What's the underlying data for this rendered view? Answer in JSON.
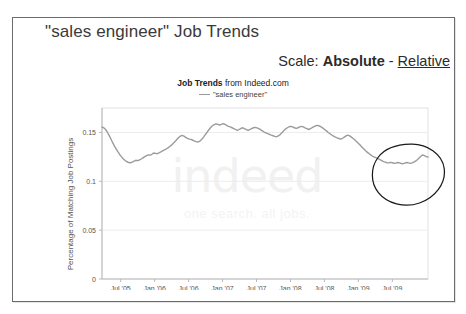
{
  "document": {
    "title": "\"sales engineer\" Job Trends"
  },
  "scale_control": {
    "label": "Scale:",
    "absolute_option": "Absolute",
    "separator": "-",
    "relative_option": "Relative",
    "selected": "Absolute"
  },
  "chart_header": {
    "source_bold": "Job Trends",
    "source_rest": " from Indeed.com",
    "legend_label": "\"sales engineer\""
  },
  "watermark": {
    "brand": "indeed",
    "tagline": "one search. all jobs."
  },
  "annotation": {
    "shape": "hand-drawn-ellipse",
    "note": "highlights the recent upturn at the right end of the curve"
  },
  "colors": {
    "line": "#9b9b9b",
    "grid": "#e7e7ea",
    "axis": "#b9b9bd",
    "frame": "#6b6b6b",
    "text": "#333333",
    "annotation": "#1a1a1a"
  },
  "chart_data": {
    "type": "line",
    "title": "Job Trends from Indeed.com",
    "xlabel": "",
    "ylabel": "Percentage of Matching Job Postings",
    "ylim": [
      0,
      0.175
    ],
    "yticks": [
      0,
      0.05,
      0.1,
      0.15
    ],
    "ytick_labels": [
      "0",
      "0.05",
      "0.1",
      "0.15"
    ],
    "xtick_labels": [
      "Jul '05",
      "Jan '06",
      "Jul '06",
      "Jan '07",
      "Jul '07",
      "Jan '08",
      "Jul '08",
      "Jan '09",
      "Jul '09"
    ],
    "grid": true,
    "legend": [
      "\"sales engineer\""
    ],
    "legend_position": "top-center",
    "series": [
      {
        "name": "\"sales engineer\"",
        "values": [
          0.1555,
          0.1548,
          0.153,
          0.1502,
          0.147,
          0.1432,
          0.1395,
          0.136,
          0.133,
          0.13,
          0.1272,
          0.125,
          0.1228,
          0.1212,
          0.12,
          0.1192,
          0.119,
          0.1196,
          0.1206,
          0.1215,
          0.1212,
          0.1218,
          0.1228,
          0.124,
          0.1252,
          0.1262,
          0.127,
          0.1268,
          0.1276,
          0.129,
          0.1286,
          0.1282,
          0.129,
          0.13,
          0.1312,
          0.1322,
          0.133,
          0.1342,
          0.1356,
          0.137,
          0.1388,
          0.1406,
          0.1428,
          0.1448,
          0.1462,
          0.147,
          0.1462,
          0.145,
          0.144,
          0.1432,
          0.1428,
          0.142,
          0.1412,
          0.1405,
          0.1402,
          0.1412,
          0.143,
          0.1452,
          0.1478,
          0.1502,
          0.1528,
          0.155,
          0.1568,
          0.158,
          0.1588,
          0.1582,
          0.1576,
          0.1582,
          0.159,
          0.1584,
          0.1572,
          0.1562,
          0.1556,
          0.1548,
          0.154,
          0.153,
          0.152,
          0.153,
          0.1542,
          0.1548,
          0.1538,
          0.1528,
          0.1522,
          0.153,
          0.154,
          0.1548,
          0.1552,
          0.1546,
          0.1538,
          0.1528,
          0.1516,
          0.1504,
          0.1496,
          0.1488,
          0.148,
          0.1472,
          0.1466,
          0.146,
          0.1456,
          0.1464,
          0.1478,
          0.1496,
          0.1516,
          0.1534,
          0.1548,
          0.1558,
          0.1562,
          0.1556,
          0.1548,
          0.1542,
          0.1548,
          0.1556,
          0.1562,
          0.1556,
          0.1546,
          0.1538,
          0.153,
          0.1538,
          0.155,
          0.156,
          0.1568,
          0.1572,
          0.1566,
          0.1556,
          0.1544,
          0.153,
          0.1516,
          0.15,
          0.1486,
          0.1474,
          0.1462,
          0.1452,
          0.1444,
          0.1438,
          0.1432,
          0.144,
          0.1452,
          0.1464,
          0.1472,
          0.1464,
          0.1452,
          0.1438,
          0.1422,
          0.1404,
          0.1386,
          0.1368,
          0.1348,
          0.133,
          0.1312,
          0.1296,
          0.1282,
          0.1268,
          0.1256,
          0.1248,
          0.124,
          0.1232,
          0.1222,
          0.1212,
          0.1202,
          0.1196,
          0.119,
          0.1188,
          0.1194,
          0.119,
          0.1184,
          0.1186,
          0.1192,
          0.1188,
          0.1182,
          0.118,
          0.1186,
          0.1192,
          0.1188,
          0.1184,
          0.1188,
          0.1196,
          0.1206,
          0.122,
          0.1238,
          0.1256,
          0.127,
          0.1262,
          0.1252,
          0.1248
        ],
        "y_first": 0.1555,
        "y_last": 0.1248,
        "y_max": 0.159,
        "y_min": 0.118
      }
    ]
  }
}
